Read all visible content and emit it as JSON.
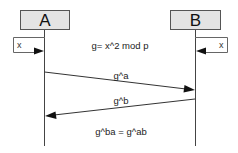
{
  "diagram": {
    "type": "sequence",
    "participants": [
      {
        "id": "A",
        "label": "A"
      },
      {
        "id": "B",
        "label": "B"
      }
    ],
    "local_vars": {
      "A": {
        "label": "x"
      },
      "B": {
        "label": "x"
      }
    },
    "note": "g= x^2 mod p",
    "messages": [
      {
        "from": "A",
        "to": "B",
        "label": "g^a"
      },
      {
        "from": "B",
        "to": "A",
        "label": "g^b"
      }
    ],
    "result": "g^ba = g^ab"
  },
  "colors": {
    "participant_fill": "#e4e4e4",
    "line": "#333333",
    "background": "#ffffff"
  }
}
